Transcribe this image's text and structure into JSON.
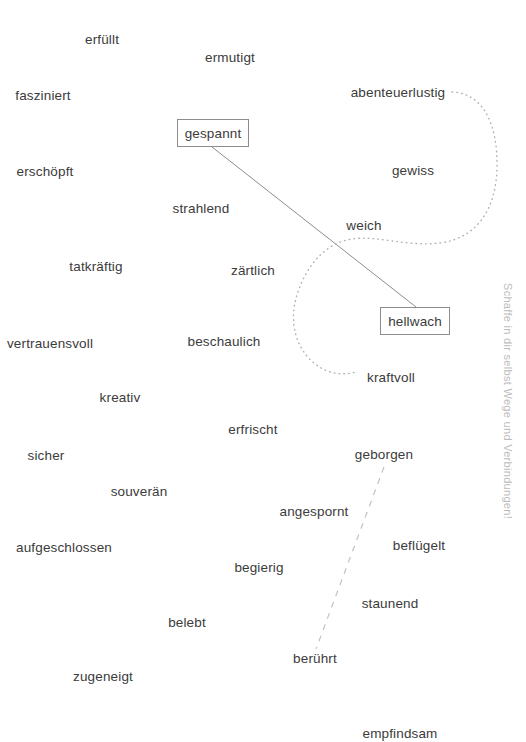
{
  "canvas": {
    "width": 526,
    "height": 742,
    "background": "#ffffff",
    "text_color": "#3b3b3b",
    "line_color": "#8d8d8d",
    "dotted_color": "#b0b0b0",
    "dashed_color": "#c2c2c2",
    "note_color": "#bcbcbc"
  },
  "side_note": {
    "text": "Schaffe in dir selbst Wege und Verbindungen!"
  },
  "words": [
    {
      "label": "erfüllt",
      "x": 102,
      "y": 40,
      "boxed": false
    },
    {
      "label": "ermutigt",
      "x": 230,
      "y": 58,
      "boxed": false
    },
    {
      "label": "fasziniert",
      "x": 43,
      "y": 96,
      "boxed": false
    },
    {
      "label": "abenteuerlustig",
      "x": 398,
      "y": 93,
      "boxed": false
    },
    {
      "label": "gespannt",
      "x": 213,
      "y": 133,
      "boxed": true,
      "box_w": 72,
      "box_h": 28
    },
    {
      "label": "erschöpft",
      "x": 45,
      "y": 172,
      "boxed": false
    },
    {
      "label": "gewiss",
      "x": 413,
      "y": 171,
      "boxed": false
    },
    {
      "label": "strahlend",
      "x": 201,
      "y": 209,
      "boxed": false
    },
    {
      "label": "weich",
      "x": 364,
      "y": 226,
      "boxed": false
    },
    {
      "label": "tatkräftig",
      "x": 96,
      "y": 267,
      "boxed": false
    },
    {
      "label": "zärtlich",
      "x": 253,
      "y": 271,
      "boxed": false
    },
    {
      "label": "hellwach",
      "x": 415,
      "y": 321,
      "boxed": true,
      "box_w": 70,
      "box_h": 28
    },
    {
      "label": "vertrauensvoll",
      "x": 50,
      "y": 344,
      "boxed": false
    },
    {
      "label": "beschaulich",
      "x": 224,
      "y": 342,
      "boxed": false
    },
    {
      "label": "kraftvoll",
      "x": 391,
      "y": 378,
      "boxed": false
    },
    {
      "label": "kreativ",
      "x": 120,
      "y": 398,
      "boxed": false
    },
    {
      "label": "erfrisch nt",
      "x": 253,
      "y": 430,
      "boxed": false,
      "display": "erfrischt"
    },
    {
      "label": "geborgen",
      "x": 384,
      "y": 455,
      "boxed": false
    },
    {
      "label": "sicher",
      "x": 46,
      "y": 456,
      "boxed": false
    },
    {
      "label": "souverän",
      "x": 139,
      "y": 492,
      "boxed": false
    },
    {
      "label": "angespornt",
      "x": 314,
      "y": 512,
      "boxed": false
    },
    {
      "label": "aufgeschlossen",
      "x": 64,
      "y": 548,
      "boxed": false
    },
    {
      "label": "beflügelt",
      "x": 419,
      "y": 546,
      "boxed": false
    },
    {
      "label": "begierig",
      "x": 259,
      "y": 568,
      "boxed": false
    },
    {
      "label": "staunend",
      "x": 390,
      "y": 604,
      "boxed": false
    },
    {
      "label": "belebt",
      "x": 187,
      "y": 623,
      "boxed": false
    },
    {
      "label": "berührt",
      "x": 315,
      "y": 659,
      "boxed": false
    },
    {
      "label": "zugeneigt",
      "x": 103,
      "y": 677,
      "boxed": false
    },
    {
      "label": "empfindsam",
      "x": 400,
      "y": 734,
      "boxed": false
    }
  ],
  "connections": [
    {
      "name": "gespannt-to-hellwach",
      "style": "solid",
      "from": "gespannt",
      "to": "hellwach",
      "path": "M 212 147 L 416 307"
    },
    {
      "name": "abenteuerlustig-to-kraftvoll",
      "style": "dotted",
      "from": "abenteuerlustig",
      "to": "kraftvoll",
      "path": "M 452 92 C 483 93, 498 124, 497 168 C 496 208, 478 238, 440 243 C 406 247, 377 235, 352 239 C 325 243, 306 266, 297 295 C 288 324, 297 352, 318 366 C 331 375, 345 375, 356 372"
    },
    {
      "name": "geborgen-to-beruehrt",
      "style": "dashed",
      "from": "geborgen",
      "to": "berührt",
      "path": "M 384 467 L 316 649"
    }
  ]
}
